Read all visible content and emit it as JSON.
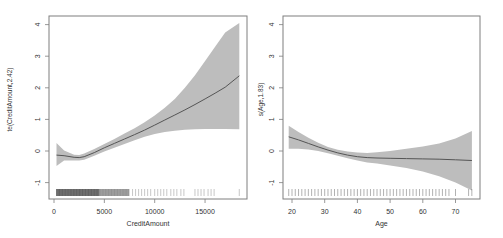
{
  "figure": {
    "colors": {
      "band": "#bdbdbd",
      "line": "#555555",
      "frame": "#7f7f7f",
      "rug": "#222222",
      "text": "#333333"
    }
  },
  "chart_data": [
    {
      "type": "line",
      "title": "",
      "xlabel": "CreditAmount",
      "ylabel": "te(CreditAmount,2.42)",
      "xlim": [
        0,
        19000
      ],
      "ylim": [
        -1.45,
        4.3
      ],
      "xticks": [
        0,
        5000,
        10000,
        15000
      ],
      "xtick_labels": [
        "0",
        "5000",
        "10000",
        "15000"
      ],
      "yticks": [
        -1,
        0,
        1,
        2,
        3,
        4
      ],
      "ytick_labels": [
        "-1",
        "0",
        "1",
        "2",
        "3",
        "4"
      ],
      "grid": false,
      "legend": null,
      "series": [
        {
          "name": "fit",
          "x": [
            250,
            1000,
            2000,
            2500,
            3000,
            4000,
            5000,
            6000,
            7000,
            8000,
            9000,
            10000,
            11000,
            12000,
            13000,
            14000,
            15000,
            16000,
            17000,
            18400
          ],
          "y": [
            -0.13,
            -0.15,
            -0.2,
            -0.21,
            -0.18,
            -0.05,
            0.1,
            0.24,
            0.38,
            0.52,
            0.66,
            0.82,
            0.98,
            1.14,
            1.3,
            1.47,
            1.65,
            1.83,
            2.02,
            2.38
          ],
          "lower": [
            -0.47,
            -0.3,
            -0.3,
            -0.3,
            -0.28,
            -0.15,
            -0.02,
            0.1,
            0.22,
            0.34,
            0.45,
            0.54,
            0.6,
            0.64,
            0.67,
            0.69,
            0.7,
            0.7,
            0.7,
            0.69
          ],
          "upper": [
            0.25,
            0.02,
            -0.12,
            -0.13,
            -0.08,
            0.06,
            0.22,
            0.38,
            0.55,
            0.72,
            0.91,
            1.12,
            1.37,
            1.65,
            2.0,
            2.4,
            2.85,
            3.3,
            3.75,
            4.05
          ]
        }
      ],
      "rug": {
        "axis": "x",
        "dense_range": [
          250,
          7500
        ],
        "sparse_values": [
          7800,
          8100,
          8400,
          8700,
          9000,
          9300,
          9600,
          10000,
          10300,
          10600,
          10900,
          11200,
          11600,
          11900,
          12200,
          12600,
          12900,
          14000,
          14300,
          14600,
          14900,
          15300,
          15600,
          15900,
          18400
        ]
      }
    },
    {
      "type": "line",
      "title": "",
      "xlabel": "Age",
      "ylabel": "s(Age,1.83)",
      "xlim": [
        17.5,
        76.5
      ],
      "ylim": [
        -1.45,
        4.3
      ],
      "xticks": [
        20,
        30,
        40,
        50,
        60,
        70
      ],
      "xtick_labels": [
        "20",
        "30",
        "40",
        "50",
        "60",
        "70"
      ],
      "yticks": [
        -1,
        0,
        1,
        2,
        3,
        4
      ],
      "ytick_labels": [
        "-1",
        "0",
        "1",
        "2",
        "3",
        "4"
      ],
      "grid": false,
      "legend": null,
      "series": [
        {
          "name": "fit",
          "x": [
            19,
            22,
            25,
            28,
            31,
            34,
            37,
            40,
            43,
            46,
            50,
            55,
            60,
            65,
            70,
            75
          ],
          "y": [
            0.45,
            0.35,
            0.24,
            0.13,
            0.03,
            -0.06,
            -0.13,
            -0.18,
            -0.21,
            -0.22,
            -0.23,
            -0.24,
            -0.25,
            -0.26,
            -0.28,
            -0.3
          ],
          "lower": [
            0.07,
            0.07,
            0.05,
            0.0,
            -0.07,
            -0.15,
            -0.23,
            -0.3,
            -0.36,
            -0.4,
            -0.46,
            -0.54,
            -0.65,
            -0.8,
            -1.0,
            -1.25
          ],
          "upper": [
            0.8,
            0.6,
            0.42,
            0.26,
            0.13,
            0.04,
            -0.02,
            -0.05,
            -0.06,
            -0.04,
            0.0,
            0.07,
            0.14,
            0.24,
            0.4,
            0.63
          ]
        }
      ],
      "rug": {
        "axis": "x",
        "values": [
          19,
          20,
          21,
          22,
          23,
          24,
          25,
          26,
          27,
          28,
          29,
          30,
          31,
          32,
          33,
          34,
          35,
          36,
          37,
          38,
          39,
          40,
          41,
          42,
          43,
          44,
          45,
          46,
          47,
          48,
          49,
          50,
          51,
          52,
          53,
          54,
          55,
          56,
          57,
          58,
          59,
          60,
          61,
          62,
          63,
          64,
          65,
          66,
          67,
          68,
          70,
          74,
          75
        ]
      }
    }
  ]
}
